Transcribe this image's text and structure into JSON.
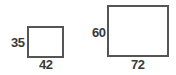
{
  "diagram": {
    "shapes": [
      {
        "name": "small-rectangle",
        "height_label": "35",
        "width_label": "42",
        "height_value": 35,
        "width_value": 42
      },
      {
        "name": "large-rectangle",
        "height_label": "60",
        "width_label": "72",
        "height_value": 60,
        "width_value": 72
      }
    ],
    "colors": {
      "stroke": "#555555",
      "text": "#3a3a3a",
      "background": "#ffffff"
    }
  }
}
